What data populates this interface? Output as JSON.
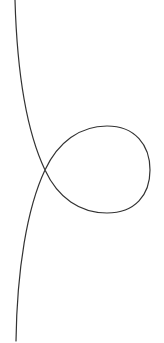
{
  "diagram": {
    "type": "curve",
    "stroke_color": "#333333",
    "background_color": "#ffffff",
    "stroke_width": 1.2,
    "points": {
      "start": [
        15,
        0
      ],
      "crossing": [
        45,
        170
      ],
      "loop_top": [
        105,
        126
      ],
      "loop_right": [
        150,
        170
      ],
      "loop_bottom": [
        105,
        213
      ],
      "end": [
        16,
        341
      ]
    }
  }
}
